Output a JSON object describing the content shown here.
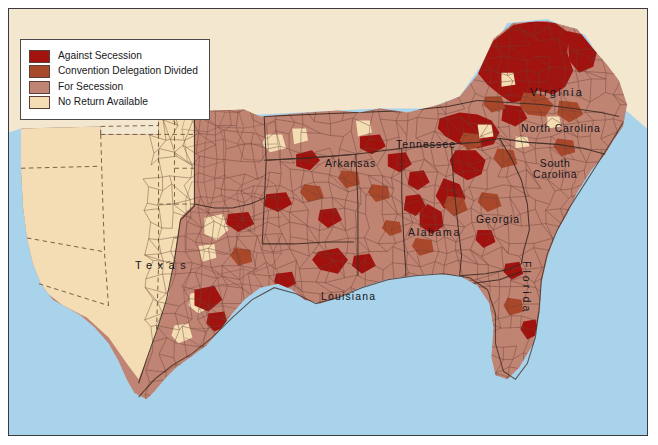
{
  "map": {
    "title_visible": false,
    "frame": {
      "border_color": "#3a3a3c",
      "page_color": "#f3e7cf"
    },
    "water_color": "#a9d3ea",
    "county_outline_color": "#5b3a2e",
    "state_outline_color": "#3b2a22",
    "categories": [
      {
        "key": "against",
        "label": "Against Secession",
        "color": "#a21310"
      },
      {
        "key": "divided",
        "label": "Convention Delegation Divided",
        "color": "#a9492c"
      },
      {
        "key": "for",
        "label": "For Secession",
        "color": "#c08474"
      },
      {
        "key": "noreturn",
        "label": "No Return Available",
        "color": "#f4ddb4"
      }
    ],
    "state_labels": [
      {
        "name": "virginia",
        "text": "Virginia"
      },
      {
        "name": "north-carolina",
        "text": "North Carolina"
      },
      {
        "name": "south-carolina",
        "text": "South"
      },
      {
        "name": "south-carolina2",
        "text": "Carolina"
      },
      {
        "name": "tennessee",
        "text": "Tennessee"
      },
      {
        "name": "arkansas",
        "text": "Arkansas"
      },
      {
        "name": "georgia",
        "text": "Georgia"
      },
      {
        "name": "alabama",
        "text": "Alabama"
      },
      {
        "name": "louisiana",
        "text": "Louisiana"
      },
      {
        "name": "texas",
        "text": "Texas"
      },
      {
        "name": "florida",
        "text": "Florida"
      }
    ]
  },
  "chart_data": {
    "type": "map",
    "legend_position": "top-left",
    "categories": [
      "Against Secession",
      "Convention Delegation Divided",
      "For Secession",
      "No Return Available"
    ],
    "colors": [
      "#a21310",
      "#a9492c",
      "#c08474",
      "#f4ddb4"
    ],
    "states_depicted": [
      "Texas",
      "Arkansas",
      "Louisiana",
      "Tennessee",
      "Alabama",
      "Georgia",
      "Florida",
      "South Carolina",
      "North Carolina",
      "Virginia"
    ]
  }
}
